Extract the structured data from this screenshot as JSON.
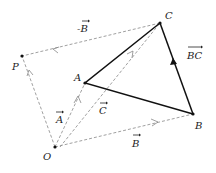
{
  "diagram": {
    "points": {
      "O": {
        "label": "O",
        "x": 55,
        "y": 147
      },
      "A": {
        "label": "A",
        "x": 85,
        "y": 83
      },
      "B": {
        "label": "B",
        "x": 193,
        "y": 114
      },
      "C": {
        "label": "C",
        "x": 160,
        "y": 23
      },
      "P": {
        "label": "P",
        "x": 22,
        "y": 56
      }
    },
    "vectors": {
      "A": {
        "label": "A",
        "from": "O",
        "to": "A",
        "style": "dashed"
      },
      "B": {
        "label": "B",
        "from": "O",
        "to": "B",
        "style": "dashed"
      },
      "C": {
        "label": "C",
        "from": "O",
        "to": "C",
        "style": "dashed"
      },
      "negB": {
        "label": "-B",
        "from": "C",
        "to": "P",
        "style": "dashed"
      },
      "OP": {
        "label": "",
        "from": "O",
        "to": "P",
        "style": "dashed"
      },
      "BC": {
        "label": "BC",
        "from": "B",
        "to": "C",
        "style": "solid"
      }
    },
    "triangle": [
      "A",
      "B",
      "C"
    ],
    "colors": {
      "solid": "#111111",
      "dashed": "#888888",
      "text": "#222222"
    }
  }
}
